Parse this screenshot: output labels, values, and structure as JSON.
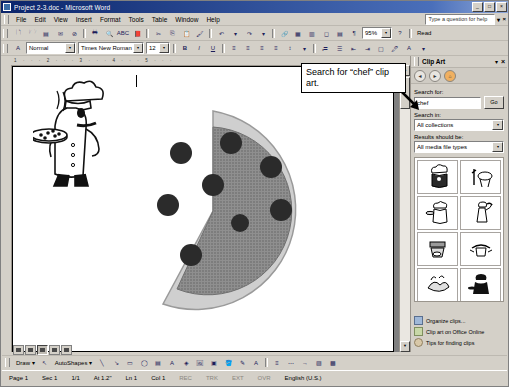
{
  "window": {
    "title": "Project 2-3.doc - Microsoft Word",
    "minimize": "_",
    "maximize": "□",
    "close": "×"
  },
  "menu": {
    "items": [
      "File",
      "Edit",
      "View",
      "Insert",
      "Format",
      "Tools",
      "Table",
      "Window",
      "Help"
    ],
    "help_placeholder": "Type a question for help",
    "help_close": "×",
    "help_dropdown": "▾"
  },
  "standard_toolbar": {
    "buttons": [
      "new",
      "open",
      "save",
      "mail",
      "print",
      "preview",
      "spelling",
      "research",
      "cut",
      "copy",
      "paste",
      "format-painter",
      "undo",
      "redo",
      "hyperlink",
      "tables",
      "columns",
      "drawing",
      "document-map"
    ],
    "zoom_value": "95%",
    "read_label": "Read",
    "help_button": "?"
  },
  "formatting_toolbar": {
    "style_value": "Normal",
    "font_value": "Times New Roman",
    "size_value": "12",
    "bold": "B",
    "italic": "I",
    "underline": "U",
    "align_buttons": [
      "align-left",
      "align-center",
      "align-right",
      "justify"
    ],
    "list_buttons": [
      "line-spacing",
      "numbering",
      "bullets",
      "decrease-indent",
      "increase-indent",
      "outside-border",
      "highlight",
      "font-color"
    ]
  },
  "ruler": {
    "horizontal_marks": "1 · · · 2 · · · 3 · · · 4 · · · 5 · · ·"
  },
  "callout": {
    "text": "Search for “chef” clip art."
  },
  "task_pane": {
    "title": "Clip Art",
    "dropdown": "▾",
    "close": "×",
    "nav": [
      "back-arrow",
      "forward-arrow",
      "home"
    ],
    "nav_glyphs": [
      "◄",
      "►",
      "⌂"
    ],
    "search_label": "Search for:",
    "search_value": "chef",
    "go_label": "Go",
    "search_in_label": "Search in:",
    "search_in_value": "All collections",
    "results_label": "Results should be:",
    "results_value": "All media file types",
    "dropdown_arrow": "▾",
    "thumbnails": [
      {
        "name": "chef-thumb-1",
        "glyph": "👨‍🍳"
      },
      {
        "name": "grill-thumb",
        "glyph": "🍖"
      },
      {
        "name": "chef-thumb-2",
        "glyph": "🧑‍🍳"
      },
      {
        "name": "waiter-thumb",
        "glyph": "🍽"
      },
      {
        "name": "pot-thumb",
        "glyph": "🍲"
      },
      {
        "name": "chef-thumb-3",
        "glyph": "🥣"
      },
      {
        "name": "cooking-thumb",
        "glyph": "🍳"
      },
      {
        "name": "chef-silhouette-thumb",
        "glyph": "🎩"
      }
    ],
    "links": [
      {
        "label": "Organize clips...",
        "icon": "organize-icon"
      },
      {
        "label": "Clip art on Office Online",
        "icon": "globe-icon"
      },
      {
        "label": "Tips for finding clips",
        "icon": "help-icon"
      }
    ]
  },
  "drawing_toolbar": {
    "draw_label": "Draw",
    "autoshapes_label": "AutoShapes",
    "dropdown": "▾",
    "tools": [
      "line",
      "arrow",
      "rectangle",
      "oval",
      "textbox",
      "wordart",
      "diagram",
      "clipart",
      "picture",
      "fill-color",
      "line-color",
      "font-color"
    ]
  },
  "status_bar": {
    "page": "Page 1",
    "section": "Sec 1",
    "pages": "1/1",
    "at": "At 1.2\"",
    "line": "Ln 1",
    "column": "Col 1",
    "rec": "REC",
    "trk": "TRK",
    "ext": "EXT",
    "ovr": "OVR",
    "language": "English (U.S.)"
  },
  "view_buttons": [
    "normal-view",
    "web-layout-view",
    "print-layout-view",
    "outline-view",
    "reading-view"
  ],
  "document": {
    "clipart_name": "chef-with-pizza-clipart",
    "pizza_name": "pizza-with-missing-slice"
  }
}
